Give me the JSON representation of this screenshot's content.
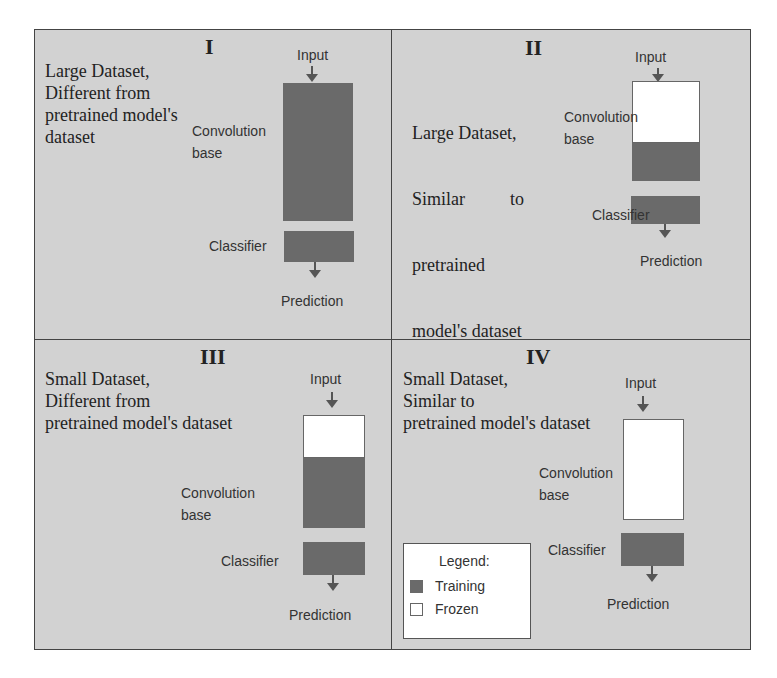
{
  "colors": {
    "training": "#6a6a6a",
    "frozen": "#ffffff",
    "background": "#d2d2d2",
    "border": "#444444"
  },
  "quadrants": [
    {
      "numeral": "I",
      "description": [
        "Large Dataset,",
        "Different from",
        "pretrained model's",
        "dataset"
      ],
      "input": "Input",
      "conv_label": [
        "Convolution",
        "base"
      ],
      "classifier": "Classifier",
      "prediction": "Prediction",
      "conv_base_state": "training",
      "classifier_state": "training"
    },
    {
      "numeral": "II",
      "description": [
        "Large Dataset,",
        "Similar          to",
        "pretrained",
        "model's dataset"
      ],
      "input": "Input",
      "conv_label": [
        "Convolution",
        "base"
      ],
      "classifier": "Classifier",
      "prediction": "Prediction",
      "conv_base_state": "partially frozen (top frozen, bottom training)",
      "classifier_state": "training"
    },
    {
      "numeral": "III",
      "description": [
        "Small Dataset,",
        "Different from",
        "pretrained model's dataset"
      ],
      "input": "Input",
      "conv_label": [
        "Convolution",
        "base"
      ],
      "classifier": "Classifier",
      "prediction": "Prediction",
      "conv_base_state": "partially frozen (top frozen, bottom training)",
      "classifier_state": "training"
    },
    {
      "numeral": "IV",
      "description": [
        "Small Dataset,",
        "Similar to",
        "pretrained model's dataset"
      ],
      "input": "Input",
      "conv_label": [
        "Convolution",
        "base"
      ],
      "classifier": "Classifier",
      "prediction": "Prediction",
      "conv_base_state": "frozen",
      "classifier_state": "training"
    }
  ],
  "legend": {
    "title": "Legend:",
    "items": [
      {
        "label": "Training",
        "swatch": "training"
      },
      {
        "label": "Frozen",
        "swatch": "frozen"
      }
    ]
  }
}
